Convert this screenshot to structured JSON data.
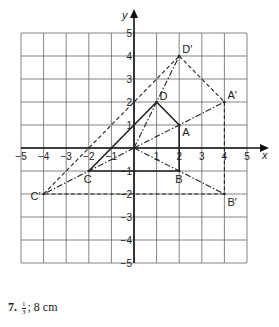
{
  "figure": {
    "axis_labels": {
      "x": "x",
      "y": "y"
    },
    "x_ticks": [
      "-5",
      "-4",
      "-3",
      "-2",
      "-1",
      "1",
      "2",
      "3",
      "4",
      "5"
    ],
    "y_ticks": [
      "5",
      "4",
      "3",
      "2",
      "1",
      "-1",
      "-2",
      "-3",
      "-4",
      "-5"
    ],
    "points": {
      "A": {
        "label": "A",
        "x": 2,
        "y": 1
      },
      "B": {
        "label": "B",
        "x": 2,
        "y": -1
      },
      "C": {
        "label": "C",
        "x": -2,
        "y": -1
      },
      "D": {
        "label": "D",
        "x": 1,
        "y": 2
      },
      "A_prime": {
        "label": "A′",
        "x": 4,
        "y": 2
      },
      "B_prime": {
        "label": "B′",
        "x": 4,
        "y": -2
      },
      "C_prime": {
        "label": "C′",
        "x": -4,
        "y": -2
      },
      "D_prime": {
        "label": "D′",
        "x": 2,
        "y": 4
      }
    },
    "colors": {
      "grid": "#555555",
      "ink": "#222222"
    }
  },
  "caption": {
    "number": "7.",
    "fraction_num": "1",
    "fraction_den": "3",
    "sep": ";",
    "text": "8 cm"
  }
}
